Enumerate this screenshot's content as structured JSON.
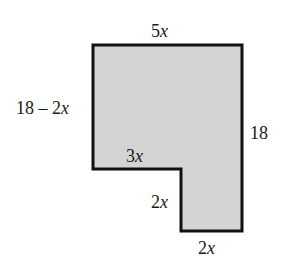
{
  "figure": {
    "shape": {
      "fill": "#d4d4d4",
      "stroke": "#111111",
      "points": [
        [
          93,
          45
        ],
        [
          242,
          45
        ],
        [
          242,
          231
        ],
        [
          181,
          231
        ],
        [
          181,
          169
        ],
        [
          93,
          169
        ]
      ]
    },
    "labels": {
      "top": {
        "coef": "5",
        "var": "x"
      },
      "left": {
        "const": "18 – 2",
        "var": "x"
      },
      "right": {
        "text": "18"
      },
      "inner_horizontal": {
        "coef": "3",
        "var": "x"
      },
      "inner_vertical": {
        "coef": "2",
        "var": "x"
      },
      "bottom": {
        "coef": "2",
        "var": "x"
      }
    }
  }
}
